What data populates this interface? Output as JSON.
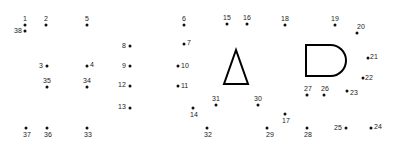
{
  "dots": [
    {
      "n": "1",
      "x": 25,
      "y": 25,
      "lx": -2,
      "ly": -10
    },
    {
      "n": "2",
      "x": 46,
      "y": 25,
      "lx": -2,
      "ly": -10
    },
    {
      "n": "3",
      "x": 47,
      "y": 66,
      "lx": -8,
      "ly": -4
    },
    {
      "n": "4",
      "x": 87,
      "y": 66,
      "lx": 3,
      "ly": -5
    },
    {
      "n": "5",
      "x": 87,
      "y": 25,
      "lx": -2,
      "ly": -10
    },
    {
      "n": "6",
      "x": 184,
      "y": 25,
      "lx": -2,
      "ly": -10
    },
    {
      "n": "7",
      "x": 184,
      "y": 44,
      "lx": 3,
      "ly": -5
    },
    {
      "n": "8",
      "x": 130,
      "y": 46,
      "lx": -8,
      "ly": -4
    },
    {
      "n": "9",
      "x": 130,
      "y": 66,
      "lx": -8,
      "ly": -4
    },
    {
      "n": "10",
      "x": 178,
      "y": 66,
      "lx": 3,
      "ly": -4
    },
    {
      "n": "11",
      "x": 178,
      "y": 86,
      "lx": 3,
      "ly": -4
    },
    {
      "n": "12",
      "x": 130,
      "y": 86,
      "lx": -12,
      "ly": -5
    },
    {
      "n": "13",
      "x": 130,
      "y": 108,
      "lx": -12,
      "ly": -5
    },
    {
      "n": "14",
      "x": 193,
      "y": 108,
      "lx": -3,
      "ly": 3
    },
    {
      "n": "15",
      "x": 227,
      "y": 24,
      "lx": -4,
      "ly": -10
    },
    {
      "n": "16",
      "x": 247,
      "y": 24,
      "lx": -4,
      "ly": -10
    },
    {
      "n": "17",
      "x": 285,
      "y": 114,
      "lx": -3,
      "ly": 3
    },
    {
      "n": "18",
      "x": 285,
      "y": 25,
      "lx": -4,
      "ly": -10
    },
    {
      "n": "19",
      "x": 335,
      "y": 25,
      "lx": -4,
      "ly": -10
    },
    {
      "n": "20",
      "x": 357,
      "y": 33,
      "lx": 0,
      "ly": -10
    },
    {
      "n": "21",
      "x": 368,
      "y": 58,
      "lx": 2,
      "ly": -5
    },
    {
      "n": "22",
      "x": 363,
      "y": 78,
      "lx": 2,
      "ly": -4
    },
    {
      "n": "23",
      "x": 347,
      "y": 91,
      "lx": 3,
      "ly": -2
    },
    {
      "n": "24",
      "x": 371,
      "y": 128,
      "lx": 3,
      "ly": -5
    },
    {
      "n": "25",
      "x": 346,
      "y": 128,
      "lx": -12,
      "ly": -4
    },
    {
      "n": "26",
      "x": 324,
      "y": 95,
      "lx": -3,
      "ly": -10
    },
    {
      "n": "27",
      "x": 307,
      "y": 95,
      "lx": -3,
      "ly": -10
    },
    {
      "n": "28",
      "x": 307,
      "y": 128,
      "lx": -3,
      "ly": 3
    },
    {
      "n": "29",
      "x": 267,
      "y": 128,
      "lx": -1,
      "ly": 3
    },
    {
      "n": "30",
      "x": 258,
      "y": 105,
      "lx": -4,
      "ly": -10
    },
    {
      "n": "31",
      "x": 216,
      "y": 105,
      "lx": -4,
      "ly": -10
    },
    {
      "n": "32",
      "x": 207,
      "y": 128,
      "lx": -3,
      "ly": 3
    },
    {
      "n": "33",
      "x": 87,
      "y": 128,
      "lx": -3,
      "ly": 3
    },
    {
      "n": "34",
      "x": 87,
      "y": 87,
      "lx": -4,
      "ly": -10
    },
    {
      "n": "35",
      "x": 47,
      "y": 87,
      "lx": -4,
      "ly": -10
    },
    {
      "n": "36",
      "x": 47,
      "y": 128,
      "lx": -3,
      "ly": 3
    },
    {
      "n": "37",
      "x": 26,
      "y": 128,
      "lx": -3,
      "ly": 3
    },
    {
      "n": "38",
      "x": 25,
      "y": 31,
      "lx": -11,
      "ly": -4
    }
  ],
  "shapes": {
    "triangle": {
      "points": "236,50 224,84 248,84"
    },
    "d_shape": {
      "left": 306,
      "top": 45,
      "right": 346,
      "bottom": 76
    }
  }
}
